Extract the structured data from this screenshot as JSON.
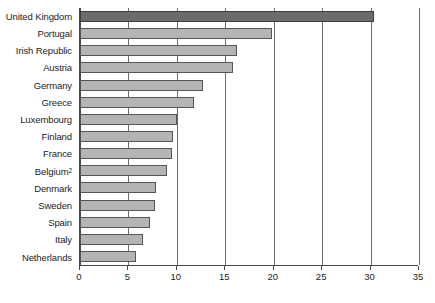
{
  "chart_data": {
    "type": "bar",
    "orientation": "horizontal",
    "title": "",
    "subtitle": "",
    "xlabel": "",
    "ylabel": "",
    "xlim": [
      0,
      35
    ],
    "xticks": [
      0,
      5,
      10,
      15,
      20,
      25,
      30,
      35
    ],
    "xtick_labels": [
      "0",
      "5",
      "10",
      "15",
      "20",
      "25",
      "30",
      "35"
    ],
    "grid": true,
    "grid_axis": "x",
    "legend": false,
    "categories": [
      "United Kingdom",
      "Portugal",
      "Irish Republic",
      "Austria",
      "Germany",
      "Greece",
      "Luxembourg",
      "Finland",
      "France",
      "Belgium",
      "Denmark",
      "Sweden",
      "Spain",
      "Italy",
      "Netherlands"
    ],
    "category_footnotes": {
      "Belgium": "2"
    },
    "values": [
      30.4,
      19.8,
      16.2,
      15.8,
      12.7,
      11.8,
      10.0,
      9.6,
      9.5,
      9.0,
      7.8,
      7.7,
      7.2,
      6.5,
      5.8
    ],
    "bars": [
      {
        "label": "United Kingdom",
        "footnote": "",
        "value": 30.4,
        "highlight": true
      },
      {
        "label": "Portugal",
        "footnote": "",
        "value": 19.8,
        "highlight": false
      },
      {
        "label": "Irish Republic",
        "footnote": "",
        "value": 16.2,
        "highlight": false
      },
      {
        "label": "Austria",
        "footnote": "",
        "value": 15.8,
        "highlight": false
      },
      {
        "label": "Germany",
        "footnote": "",
        "value": 12.7,
        "highlight": false
      },
      {
        "label": "Greece",
        "footnote": "",
        "value": 11.8,
        "highlight": false
      },
      {
        "label": "Luxembourg",
        "footnote": "",
        "value": 10.0,
        "highlight": false
      },
      {
        "label": "Finland",
        "footnote": "",
        "value": 9.6,
        "highlight": false
      },
      {
        "label": "France",
        "footnote": "",
        "value": 9.5,
        "highlight": false
      },
      {
        "label": "Belgium",
        "footnote": "2",
        "value": 9.0,
        "highlight": false
      },
      {
        "label": "Denmark",
        "footnote": "",
        "value": 7.8,
        "highlight": false
      },
      {
        "label": "Sweden",
        "footnote": "",
        "value": 7.7,
        "highlight": false
      },
      {
        "label": "Spain",
        "footnote": "",
        "value": 7.2,
        "highlight": false
      },
      {
        "label": "Italy",
        "footnote": "",
        "value": 6.5,
        "highlight": false
      },
      {
        "label": "Netherlands",
        "footnote": "",
        "value": 5.8,
        "highlight": false
      }
    ],
    "colors": {
      "bar_fill": "#b4b4b4",
      "bar_stroke": "#555555",
      "highlight_fill": "#6b6b6b",
      "highlight_stroke": "#3d3d3d",
      "gridline": "#6e6e6e",
      "axis": "#4a4a4a",
      "text": "#1c1c1c",
      "background": "#ffffff"
    }
  }
}
